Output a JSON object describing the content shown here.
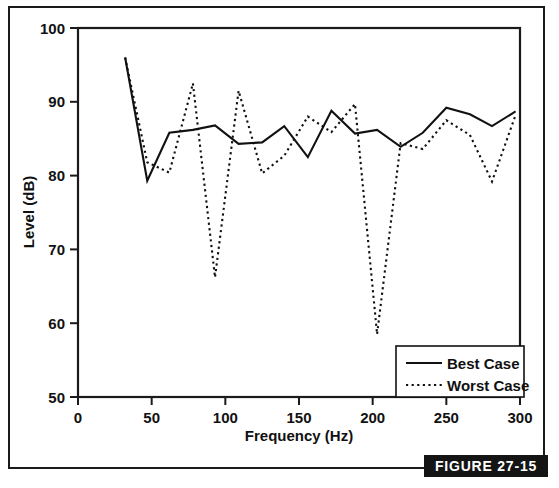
{
  "figure": {
    "badge_label": "FIGURE 27-15"
  },
  "chart_data": {
    "type": "line",
    "title": "",
    "xlabel": "Frequency  (Hz)",
    "ylabel": "Level (dB)",
    "xlim": [
      0,
      300
    ],
    "ylim": [
      50,
      100
    ],
    "xticks": [
      0,
      50,
      100,
      150,
      200,
      250,
      300
    ],
    "yticks": [
      50,
      60,
      70,
      80,
      90,
      100
    ],
    "xtick_labels": [
      "0",
      "50",
      "100",
      "150",
      "200",
      "250",
      "300"
    ],
    "ytick_labels": [
      "50",
      "60",
      "70",
      "80",
      "90",
      "100"
    ],
    "grid": false,
    "legend_position": "bottom-right",
    "x": [
      32,
      47,
      62,
      78,
      93,
      109,
      125,
      140,
      156,
      172,
      188,
      203,
      219,
      234,
      250,
      266,
      281,
      297
    ],
    "series": [
      {
        "name": "Best Case",
        "style": "solid",
        "color": "#111111",
        "values": [
          96.0,
          79.3,
          85.8,
          86.2,
          86.8,
          84.3,
          84.5,
          86.7,
          82.5,
          88.8,
          85.7,
          86.2,
          83.9,
          85.8,
          89.2,
          88.3,
          86.7,
          88.7
        ]
      },
      {
        "name": "Worst Case",
        "style": "dotted",
        "color": "#111111",
        "values": [
          96.0,
          81.8,
          80.4,
          92.5,
          66.2,
          91.5,
          80.3,
          82.7,
          88.0,
          85.9,
          89.7,
          58.5,
          84.4,
          83.6,
          87.5,
          85.5,
          79.2,
          88.2
        ]
      }
    ],
    "legend": [
      {
        "label": "Best Case",
        "style": "solid"
      },
      {
        "label": "Worst Case",
        "style": "dotted"
      }
    ]
  }
}
